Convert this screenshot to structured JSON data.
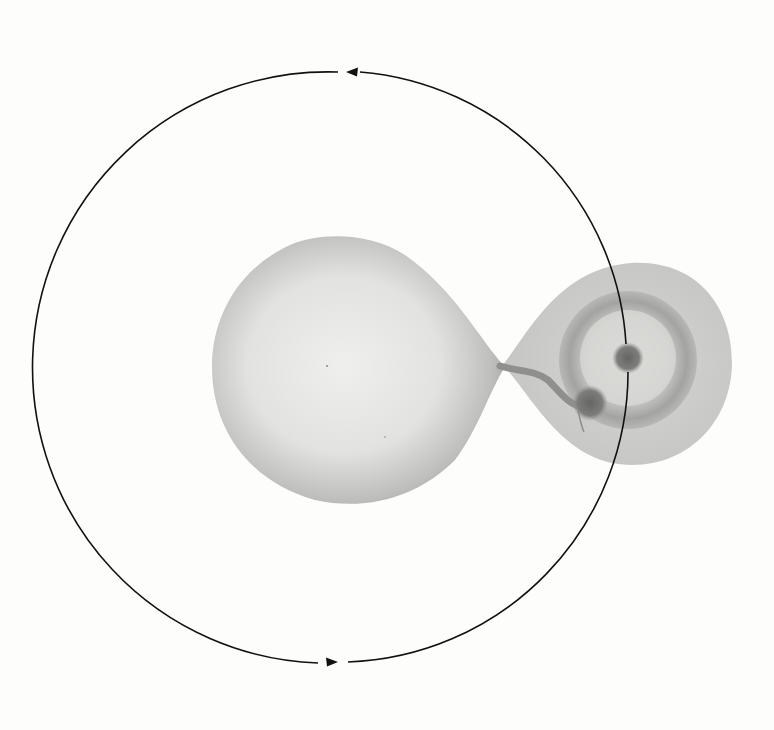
{
  "figure": {
    "type": "binary-star-mass-transfer-illustration",
    "background": "#fdfdfc",
    "orbit": {
      "center": [
        342,
        368
      ],
      "radius": 290,
      "direction": "counterclockwise",
      "arrows": [
        {
          "position": "top",
          "x": 352,
          "y": 72,
          "pointing": "left"
        },
        {
          "position": "bottom",
          "x": 336,
          "y": 662,
          "pointing": "right"
        }
      ],
      "color": "#111111"
    },
    "donor_star": {
      "shape": "roche-lobe-teardrop",
      "fill_center": "#ececea",
      "fill_edge": "#9a9a98"
    },
    "accretion_lobe": {
      "center": [
        646,
        364
      ],
      "fill": "#cfcfcd"
    },
    "accretion_disk": {
      "center": [
        628,
        360
      ],
      "radius": 68,
      "ring_color": "#9c9c9a"
    },
    "compact_object": {
      "center": [
        628,
        358
      ],
      "radius": 14,
      "color": "#6e6e6c"
    },
    "hot_spot": {
      "center": [
        590,
        403
      ],
      "radius": 16,
      "color": "#767674"
    },
    "mass_stream": {
      "color": "#9a9a98"
    }
  }
}
